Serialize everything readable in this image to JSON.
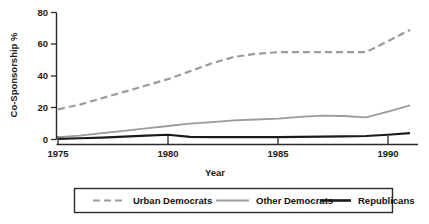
{
  "chart_data": {
    "type": "line",
    "title": "",
    "xlabel": "Year",
    "ylabel": "Co-Sponsorship %",
    "xlim": [
      1975,
      1991
    ],
    "ylim": [
      0,
      80
    ],
    "xticks": [
      1975,
      1980,
      1985,
      1990
    ],
    "xtick_labels": [
      "1975",
      "1980",
      "1985",
      "1990"
    ],
    "yticks": [
      0,
      20,
      40,
      60,
      80
    ],
    "ytick_labels": [
      "0",
      "20",
      "40",
      "60",
      "80"
    ],
    "grid": false,
    "legend_position": "bottom",
    "x": [
      1975,
      1976,
      1977,
      1978,
      1979,
      1980,
      1981,
      1982,
      1983,
      1984,
      1985,
      1986,
      1987,
      1988,
      1989,
      1990,
      1991
    ],
    "series": [
      {
        "name": "Urban Democrats",
        "color": "#9b9b9b",
        "style": "dashed",
        "width": 2.2,
        "values": [
          19,
          22,
          26,
          30,
          34,
          38,
          43,
          48,
          52,
          54,
          55,
          55,
          55,
          55,
          55,
          62,
          69
        ]
      },
      {
        "name": "Other Democrats",
        "color": "#9b9b9b",
        "style": "solid",
        "width": 1.8,
        "values": [
          1.5,
          2.5,
          4,
          5.5,
          7,
          8.5,
          10,
          11,
          12,
          12.6,
          13.2,
          14.2,
          15,
          14.8,
          14,
          17.5,
          21.5
        ]
      },
      {
        "name": "Republicans",
        "color": "#1a1a1a",
        "style": "solid",
        "width": 2.2,
        "values": [
          0.4,
          0.8,
          1.2,
          1.8,
          2.4,
          3.0,
          1.6,
          1.5,
          1.5,
          1.5,
          1.5,
          1.6,
          1.8,
          2.0,
          2.2,
          3.0,
          4.0
        ]
      }
    ]
  },
  "legend": {
    "items": [
      {
        "label": "Urban Democrats"
      },
      {
        "label": "Other Democrats"
      },
      {
        "label": "Republicans"
      }
    ]
  }
}
